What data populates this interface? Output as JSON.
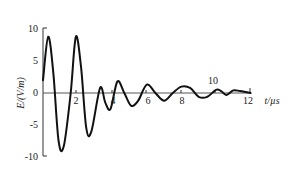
{
  "chart_data": {
    "type": "line",
    "title": "",
    "xlabel": "t/µs",
    "ylabel": "E/(V/m)",
    "xlim": [
      0,
      12
    ],
    "ylim": [
      -10,
      10
    ],
    "x_ticks": [
      "2",
      "4",
      "6",
      "8",
      "10",
      "12"
    ],
    "y_ticks": [
      "10",
      "5",
      "0",
      "-5",
      "-10"
    ],
    "grid": false,
    "legend": null,
    "series": [
      {
        "name": "E(t)",
        "x": [
          0,
          0.3,
          0.6,
          0.9,
          1.2,
          1.6,
          1.9,
          2.2,
          2.5,
          2.8,
          3.3,
          3.6,
          3.9,
          4.3,
          4.7,
          5.1,
          5.5,
          6.0,
          6.5,
          7.0,
          7.5,
          8.0,
          8.5,
          9.0,
          9.5,
          10.0,
          10.3,
          10.6,
          11.0,
          11.4,
          12.0
        ],
        "values": [
          2,
          8.8,
          3,
          -7.5,
          -8.3,
          0,
          8.8,
          4,
          -5.5,
          -6,
          0.8,
          -1.5,
          -2.5,
          1.8,
          0,
          -2,
          -1.2,
          1.3,
          0,
          -1.2,
          0,
          1,
          0.8,
          -0.6,
          -0.6,
          0.5,
          0.3,
          -0.3,
          0.4,
          0.3,
          0
        ]
      }
    ]
  },
  "axes": {
    "ylabel": "E/(V/m)",
    "xlabel": "t/µs",
    "xticks": [
      {
        "label": "2"
      },
      {
        "label": "4"
      },
      {
        "label": "6"
      },
      {
        "label": "8"
      },
      {
        "label": "10"
      },
      {
        "label": "12"
      }
    ],
    "yticks": [
      {
        "label": "10"
      },
      {
        "label": "5"
      },
      {
        "label": "0"
      },
      {
        "label": "-5"
      },
      {
        "label": "-10"
      }
    ]
  }
}
